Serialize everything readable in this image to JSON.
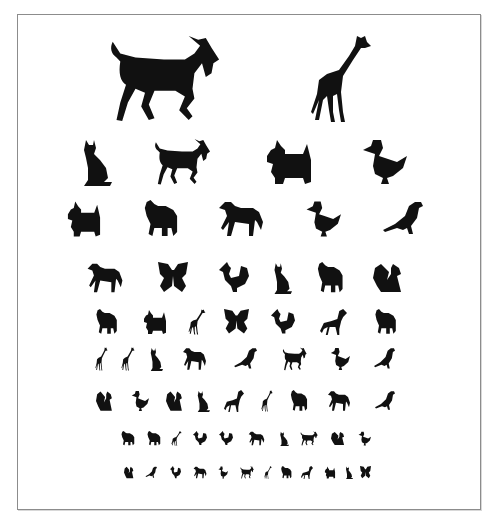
{
  "chart": {
    "title": "Animal picture eye chart",
    "ink_color": "#111111",
    "frame_color": "#8c8c8c",
    "rows": [
      {
        "y": 34,
        "h": 90,
        "animals": [
          {
            "type": "goat",
            "x": 107,
            "w": 114
          },
          {
            "type": "giraffe",
            "x": 309,
            "w": 64
          }
        ]
      },
      {
        "y": 138,
        "h": 48,
        "animals": [
          {
            "type": "cat",
            "x": 80,
            "w": 32
          },
          {
            "type": "goat",
            "x": 153,
            "w": 58
          },
          {
            "type": "scottie",
            "x": 263,
            "w": 52
          },
          {
            "type": "duck",
            "x": 361,
            "w": 46
          }
        ]
      },
      {
        "y": 200,
        "h": 38,
        "animals": [
          {
            "type": "scottie",
            "x": 65,
            "w": 38
          },
          {
            "type": "elephant",
            "x": 141,
            "w": 38
          },
          {
            "type": "horse",
            "x": 217,
            "w": 48
          },
          {
            "type": "duck",
            "x": 305,
            "w": 36
          },
          {
            "type": "bird",
            "x": 381,
            "w": 42
          }
        ]
      },
      {
        "y": 262,
        "h": 32,
        "animals": [
          {
            "type": "horse",
            "x": 86,
            "w": 38
          },
          {
            "type": "butterfly",
            "x": 158,
            "w": 30
          },
          {
            "type": "rooster",
            "x": 219,
            "w": 30
          },
          {
            "type": "cat",
            "x": 272,
            "w": 20
          },
          {
            "type": "elephant",
            "x": 315,
            "w": 29
          },
          {
            "type": "squirrel",
            "x": 373,
            "w": 30
          }
        ]
      },
      {
        "y": 309,
        "h": 26,
        "animals": [
          {
            "type": "elephant",
            "x": 94,
            "w": 24
          },
          {
            "type": "scottie",
            "x": 142,
            "w": 26
          },
          {
            "type": "giraffe",
            "x": 188,
            "w": 18
          },
          {
            "type": "butterfly",
            "x": 224,
            "w": 25
          },
          {
            "type": "rooster",
            "x": 271,
            "w": 24
          },
          {
            "type": "dog",
            "x": 320,
            "w": 27
          },
          {
            "type": "elephant",
            "x": 373,
            "w": 24
          }
        ]
      },
      {
        "y": 347,
        "h": 24,
        "animals": [
          {
            "type": "giraffe",
            "x": 95,
            "w": 13
          },
          {
            "type": "giraffe",
            "x": 121,
            "w": 14
          },
          {
            "type": "cat",
            "x": 149,
            "w": 14
          },
          {
            "type": "horse",
            "x": 182,
            "w": 25
          },
          {
            "type": "bird",
            "x": 233,
            "w": 24
          },
          {
            "type": "goat",
            "x": 282,
            "w": 25
          },
          {
            "type": "duck",
            "x": 330,
            "w": 20
          },
          {
            "type": "bird",
            "x": 373,
            "w": 22
          }
        ]
      },
      {
        "y": 390,
        "h": 22,
        "animals": [
          {
            "type": "squirrel",
            "x": 96,
            "w": 17
          },
          {
            "type": "duck",
            "x": 131,
            "w": 18
          },
          {
            "type": "squirrel",
            "x": 166,
            "w": 17
          },
          {
            "type": "cat",
            "x": 196,
            "w": 14
          },
          {
            "type": "dog",
            "x": 224,
            "w": 20
          },
          {
            "type": "giraffe",
            "x": 261,
            "w": 12
          },
          {
            "type": "elephant",
            "x": 289,
            "w": 19
          },
          {
            "type": "horse",
            "x": 327,
            "w": 24
          },
          {
            "type": "bird",
            "x": 374,
            "w": 21
          }
        ]
      },
      {
        "y": 431,
        "h": 15,
        "animals": [
          {
            "type": "elephant",
            "x": 120,
            "w": 15
          },
          {
            "type": "elephant",
            "x": 146,
            "w": 15
          },
          {
            "type": "giraffe",
            "x": 171,
            "w": 11
          },
          {
            "type": "rooster",
            "x": 193,
            "w": 14
          },
          {
            "type": "rooster",
            "x": 219,
            "w": 14
          },
          {
            "type": "horse",
            "x": 248,
            "w": 17
          },
          {
            "type": "cat",
            "x": 279,
            "w": 10
          },
          {
            "type": "goat",
            "x": 300,
            "w": 18
          },
          {
            "type": "squirrel",
            "x": 331,
            "w": 14
          },
          {
            "type": "duck",
            "x": 358,
            "w": 13
          }
        ]
      },
      {
        "y": 466,
        "h": 13,
        "animals": [
          {
            "type": "squirrel",
            "x": 124,
            "w": 10
          },
          {
            "type": "bird",
            "x": 145,
            "w": 12
          },
          {
            "type": "rooster",
            "x": 170,
            "w": 11
          },
          {
            "type": "horse",
            "x": 193,
            "w": 14
          },
          {
            "type": "duck",
            "x": 218,
            "w": 10
          },
          {
            "type": "goat",
            "x": 240,
            "w": 14
          },
          {
            "type": "giraffe",
            "x": 264,
            "w": 8
          },
          {
            "type": "elephant",
            "x": 280,
            "w": 12
          },
          {
            "type": "dog",
            "x": 301,
            "w": 12
          },
          {
            "type": "scottie",
            "x": 324,
            "w": 12
          },
          {
            "type": "cat",
            "x": 345,
            "w": 8
          },
          {
            "type": "butterfly",
            "x": 360,
            "w": 11
          }
        ]
      }
    ]
  }
}
